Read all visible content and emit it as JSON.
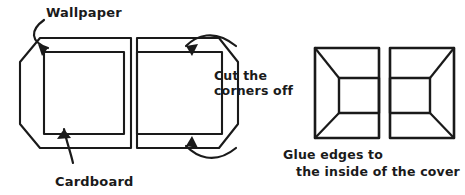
{
  "canvas": {
    "width": 465,
    "height": 195,
    "background": "#ffffff",
    "ink_color": "#1a1a1a"
  },
  "labels": {
    "wallpaper": "Wallpaper",
    "cardboard": "Cardboard",
    "cut_corners_line1": "Cut the",
    "cut_corners_line2": "corners off",
    "glue_line1": "Glue edges to",
    "glue_line2": "the inside of the cover"
  },
  "figures": [
    {
      "id": "panel-left-wallpaper",
      "name": "wallpaper-panel-left",
      "description": "Wallpaper sheet with left corners cut, cardboard rectangle inside",
      "outer_points": "20,62 20,124 40,148 131,148 131,38 40,38",
      "inner_points": "44,52 124,52 124,134 44,134"
    },
    {
      "id": "panel-right-wallpaper",
      "name": "wallpaper-panel-right",
      "description": "Mirrored wallpaper sheet with right corners cut",
      "outer_points": "137,38 219,38 238,62 238,124 219,148 137,148",
      "inner_points": "137,52 222,52 222,134 137,134"
    },
    {
      "id": "cover-box-left",
      "name": "finished-cover-left",
      "description": "Finished cover, glued edges folded inward, inner panel offset right",
      "outer_rect": {
        "x": 315,
        "y": 48,
        "width": 64,
        "height": 90
      },
      "inner_points": "339,78 379,78 379,113 339,113",
      "diagonals": [
        "315,48 339,78",
        "315,138 339,113"
      ]
    },
    {
      "id": "cover-box-right",
      "name": "finished-cover-right",
      "description": "Mirrored finished cover, inner panel offset left",
      "outer_rect": {
        "x": 390,
        "y": 48,
        "width": 64,
        "height": 90
      },
      "inner_points": "390,78 430,78 430,113 390,113",
      "diagonals": [
        "454,48 430,78",
        "454,138 430,113"
      ]
    }
  ],
  "annotations": [
    {
      "id": "arrow-wallpaper",
      "name": "wallpaper-pointer-arrow",
      "description": "Curved arrow from Wallpaper label down to the sheet edge",
      "path": "M 44,20 C 30,30 30,42 48,48",
      "head": "48,48 38,44 42,56"
    },
    {
      "id": "arrow-cardboard",
      "name": "cardboard-pointer-arrow",
      "description": "Curved arrow from Cardboard label up to inner rectangle",
      "path": "M 73,163 C 70,150 66,140 64,129",
      "head": "64,129 57,139 71,138"
    },
    {
      "id": "arrow-cut-top",
      "name": "cut-corner-top-arrow",
      "description": "Curved arrow pointing to the upper cut corner",
      "path": "M 236,46 C 214,28 196,36 186,46",
      "head": "186,46 198,44 192,56"
    },
    {
      "id": "arrow-cut-bottom",
      "name": "cut-corner-bottom-arrow",
      "description": "Curved arrow pointing to the lower cut corner",
      "path": "M 236,148 C 214,166 196,156 186,146",
      "head": "186,146 198,148 192,136"
    }
  ],
  "text_positions": {
    "wallpaper": {
      "x": 46,
      "y": 17
    },
    "cardboard": {
      "x": 55,
      "y": 186
    },
    "cut_corners_line1": {
      "x": 214,
      "y": 80
    },
    "cut_corners_line2": {
      "x": 214,
      "y": 95
    },
    "glue_line1": {
      "x": 333,
      "y": 159
    },
    "glue_line2": {
      "x": 300,
      "y": 176
    }
  }
}
